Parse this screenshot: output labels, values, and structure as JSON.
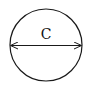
{
  "diagram": {
    "shape": "circle",
    "label": "C",
    "measurement": "diameter",
    "stroke_color": "#1a1a1a",
    "background": "#ffffff"
  }
}
